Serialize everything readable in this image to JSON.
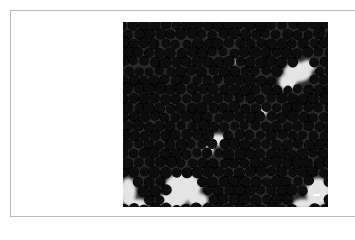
{
  "figure": {
    "alt": "Micrograph of densely packed dark spherical particles",
    "frame_border_color": "#b9b9b9",
    "background_color": "#0c0c0c",
    "particle_color": "#070707",
    "matrix_color": "#3a3a3a",
    "void_color": "#e4e4e4",
    "scale_bar": {
      "present": true,
      "color": "#ffffff"
    }
  }
}
